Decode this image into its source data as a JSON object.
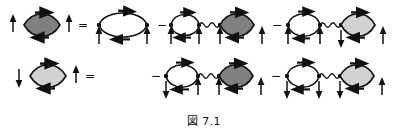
{
  "figure": {
    "caption": "図 7.1",
    "kind": "feynman-diagram-equation",
    "colors": {
      "ink": "#111111",
      "blob_dark": "#808080",
      "blob_light": "#d2d2d2",
      "background": "#ffffff"
    },
    "glyphs": {
      "spin_up": "↑",
      "spin_down": "↓",
      "equals": "=",
      "minus": "−"
    },
    "rows": [
      {
        "id": "row-1",
        "lhs": {
          "blob": "dark",
          "left_spin": "↑",
          "right_spin": "↑"
        },
        "operator": "=",
        "terms": [
          {
            "index": 1,
            "sign": "",
            "type": "bare-bubble",
            "blob": "none",
            "spins": [
              "↑",
              "↑"
            ]
          },
          {
            "index": 2,
            "sign": "−",
            "type": "bubble-wavy-blob",
            "blob": "dark",
            "spins": [
              "↑",
              "↑",
              "↑",
              "↑"
            ]
          },
          {
            "index": 3,
            "sign": "−",
            "type": "bubble-wavy-blob",
            "blob": "light",
            "spins": [
              "↑",
              "↑",
              "↓",
              "↑"
            ]
          }
        ]
      },
      {
        "id": "row-2",
        "lhs": {
          "blob": "light",
          "left_spin": "↓",
          "right_spin": "↑"
        },
        "operator": "=",
        "terms": [
          {
            "index": 1,
            "sign": "−",
            "type": "bubble-wavy-blob",
            "blob": "dark",
            "spins": [
              "↓",
              "↑",
              "↑",
              "↑"
            ]
          },
          {
            "index": 2,
            "sign": "−",
            "type": "bubble-wavy-blob",
            "blob": "light",
            "spins": [
              "↓",
              "↓",
              "↓",
              "↑"
            ]
          }
        ]
      }
    ]
  }
}
